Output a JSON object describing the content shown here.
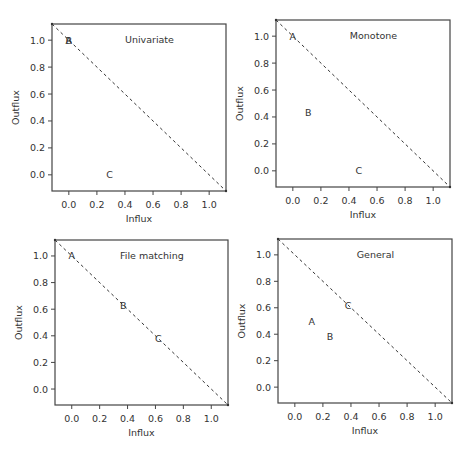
{
  "chart_data": [
    {
      "type": "scatter",
      "title": "Univariate",
      "xlabel": "Influx",
      "ylabel": "Outflux",
      "xlim": [
        -0.12,
        1.12
      ],
      "ylim": [
        -0.12,
        1.12
      ],
      "xticks": [
        0.0,
        0.2,
        0.4,
        0.6,
        0.8,
        1.0
      ],
      "yticks": [
        0.0,
        0.2,
        0.4,
        0.6,
        0.8,
        1.0
      ],
      "tick_labels": [
        "0.0",
        "0.2",
        "0.4",
        "0.6",
        "0.8",
        "1.0"
      ],
      "grid": false,
      "reference_line": {
        "style": "dashed",
        "from": [
          -0.12,
          1.12
        ],
        "to": [
          1.12,
          -0.12
        ]
      },
      "points": [
        {
          "label": "A",
          "x": 0.0,
          "y": 1.0
        },
        {
          "label": "B",
          "x": 0.0,
          "y": 1.0
        },
        {
          "label": "C",
          "x": 0.29,
          "y": 0.0
        }
      ]
    },
    {
      "type": "scatter",
      "title": "Monotone",
      "xlabel": "Influx",
      "ylabel": "Outflux",
      "xlim": [
        -0.12,
        1.12
      ],
      "ylim": [
        -0.12,
        1.12
      ],
      "xticks": [
        0.0,
        0.2,
        0.4,
        0.6,
        0.8,
        1.0
      ],
      "yticks": [
        0.0,
        0.2,
        0.4,
        0.6,
        0.8,
        1.0
      ],
      "tick_labels": [
        "0.0",
        "0.2",
        "0.4",
        "0.6",
        "0.8",
        "1.0"
      ],
      "grid": false,
      "reference_line": {
        "style": "dashed",
        "from": [
          -0.12,
          1.12
        ],
        "to": [
          1.12,
          -0.12
        ]
      },
      "points": [
        {
          "label": "A",
          "x": 0.0,
          "y": 1.0
        },
        {
          "label": "B",
          "x": 0.11,
          "y": 0.43
        },
        {
          "label": "C",
          "x": 0.47,
          "y": 0.0
        }
      ]
    },
    {
      "type": "scatter",
      "title": "File matching",
      "xlabel": "Influx",
      "ylabel": "Outflux",
      "xlim": [
        -0.12,
        1.12
      ],
      "ylim": [
        -0.12,
        1.12
      ],
      "xticks": [
        0.0,
        0.2,
        0.4,
        0.6,
        0.8,
        1.0
      ],
      "yticks": [
        0.0,
        0.2,
        0.4,
        0.6,
        0.8,
        1.0
      ],
      "tick_labels": [
        "0.0",
        "0.2",
        "0.4",
        "0.6",
        "0.8",
        "1.0"
      ],
      "grid": false,
      "reference_line": {
        "style": "dashed",
        "from": [
          -0.12,
          1.12
        ],
        "to": [
          1.12,
          -0.12
        ]
      },
      "points": [
        {
          "label": "A",
          "x": 0.0,
          "y": 1.0
        },
        {
          "label": "B",
          "x": 0.37,
          "y": 0.63
        },
        {
          "label": "C",
          "x": 0.62,
          "y": 0.38
        }
      ]
    },
    {
      "type": "scatter",
      "title": "General",
      "xlabel": "Influx",
      "ylabel": "Outflux",
      "xlim": [
        -0.12,
        1.12
      ],
      "ylim": [
        -0.12,
        1.12
      ],
      "xticks": [
        0.0,
        0.2,
        0.4,
        0.6,
        0.8,
        1.0
      ],
      "yticks": [
        0.0,
        0.2,
        0.4,
        0.6,
        0.8,
        1.0
      ],
      "tick_labels": [
        "0.0",
        "0.2",
        "0.4",
        "0.6",
        "0.8",
        "1.0"
      ],
      "grid": false,
      "reference_line": {
        "style": "dashed",
        "from": [
          -0.12,
          1.12
        ],
        "to": [
          1.12,
          -0.12
        ]
      },
      "points": [
        {
          "label": "A",
          "x": 0.12,
          "y": 0.5
        },
        {
          "label": "B",
          "x": 0.25,
          "y": 0.38
        },
        {
          "label": "C",
          "x": 0.38,
          "y": 0.62
        }
      ]
    }
  ],
  "layout": {
    "panels": [
      {
        "left": 52,
        "top": 24,
        "right": 226,
        "bottom": 191
      },
      {
        "left": 276,
        "top": 20,
        "right": 450,
        "bottom": 187
      },
      {
        "left": 55,
        "top": 240,
        "right": 228,
        "bottom": 405
      },
      {
        "left": 278,
        "top": 239,
        "right": 452,
        "bottom": 403
      }
    ],
    "colors": {
      "axis": "#444444",
      "text": "#333333",
      "dash": "#333333",
      "background": "#ffffff"
    }
  }
}
